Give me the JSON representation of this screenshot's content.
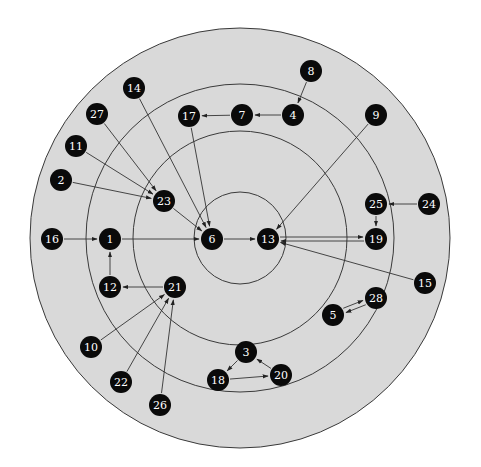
{
  "diagram": {
    "type": "concentric-directed-graph",
    "center": [
      240,
      238
    ],
    "colors": {
      "background": "#ffffff",
      "disk": "#d9d9d9",
      "ring_stroke": "#3a3a3a",
      "node": "#0a0a0a",
      "node_text": "#ffffff",
      "edge": "#333333"
    },
    "rings": [
      {
        "id": "outer",
        "r": 210,
        "fill": true
      },
      {
        "id": "ring3",
        "r": 154
      },
      {
        "id": "ring2",
        "r": 107
      },
      {
        "id": "ring1",
        "r": 46
      }
    ],
    "node_radius": 11,
    "nodes": [
      {
        "id": "1",
        "label": "1",
        "x": 110,
        "y": 239
      },
      {
        "id": "2",
        "label": "2",
        "x": 61,
        "y": 180
      },
      {
        "id": "3",
        "label": "3",
        "x": 246,
        "y": 352
      },
      {
        "id": "4",
        "label": "4",
        "x": 293,
        "y": 115
      },
      {
        "id": "5",
        "label": "5",
        "x": 333,
        "y": 315
      },
      {
        "id": "6",
        "label": "6",
        "x": 212,
        "y": 239
      },
      {
        "id": "7",
        "label": "7",
        "x": 242,
        "y": 115
      },
      {
        "id": "8",
        "label": "8",
        "x": 311,
        "y": 71
      },
      {
        "id": "9",
        "label": "9",
        "x": 376,
        "y": 115
      },
      {
        "id": "10",
        "label": "10",
        "x": 91,
        "y": 347
      },
      {
        "id": "11",
        "label": "11",
        "x": 76,
        "y": 146
      },
      {
        "id": "12",
        "label": "12",
        "x": 110,
        "y": 287
      },
      {
        "id": "13",
        "label": "13",
        "x": 268,
        "y": 239
      },
      {
        "id": "14",
        "label": "14",
        "x": 134,
        "y": 88
      },
      {
        "id": "15",
        "label": "15",
        "x": 425,
        "y": 283
      },
      {
        "id": "16",
        "label": "16",
        "x": 52,
        "y": 239
      },
      {
        "id": "17",
        "label": "17",
        "x": 189,
        "y": 116
      },
      {
        "id": "18",
        "label": "18",
        "x": 218,
        "y": 380
      },
      {
        "id": "19",
        "label": "19",
        "x": 376,
        "y": 239
      },
      {
        "id": "20",
        "label": "20",
        "x": 281,
        "y": 375
      },
      {
        "id": "21",
        "label": "21",
        "x": 175,
        "y": 287
      },
      {
        "id": "22",
        "label": "22",
        "x": 121,
        "y": 382
      },
      {
        "id": "23",
        "label": "23",
        "x": 164,
        "y": 201
      },
      {
        "id": "24",
        "label": "24",
        "x": 429,
        "y": 204
      },
      {
        "id": "25",
        "label": "25",
        "x": 376,
        "y": 204
      },
      {
        "id": "26",
        "label": "26",
        "x": 160,
        "y": 405
      },
      {
        "id": "27",
        "label": "27",
        "x": 97,
        "y": 114
      },
      {
        "id": "28",
        "label": "28",
        "x": 376,
        "y": 298
      }
    ],
    "edges": [
      {
        "from": "8",
        "to": "4"
      },
      {
        "from": "4",
        "to": "7"
      },
      {
        "from": "7",
        "to": "17"
      },
      {
        "from": "17",
        "to": "6"
      },
      {
        "from": "14",
        "to": "6"
      },
      {
        "from": "23",
        "to": "6"
      },
      {
        "from": "27",
        "to": "23"
      },
      {
        "from": "11",
        "to": "23"
      },
      {
        "from": "2",
        "to": "23"
      },
      {
        "from": "16",
        "to": "1"
      },
      {
        "from": "1",
        "to": "6"
      },
      {
        "from": "12",
        "to": "1"
      },
      {
        "from": "21",
        "to": "12"
      },
      {
        "from": "10",
        "to": "21"
      },
      {
        "from": "22",
        "to": "21"
      },
      {
        "from": "26",
        "to": "21"
      },
      {
        "from": "6",
        "to": "13"
      },
      {
        "from": "13",
        "to": "19",
        "offset": -2
      },
      {
        "from": "19",
        "to": "13",
        "offset": -2
      },
      {
        "from": "9",
        "to": "13"
      },
      {
        "from": "15",
        "to": "13"
      },
      {
        "from": "24",
        "to": "25"
      },
      {
        "from": "25",
        "to": "19"
      },
      {
        "from": "5",
        "to": "28",
        "offset": -2.5
      },
      {
        "from": "28",
        "to": "5",
        "offset": -2.5
      },
      {
        "from": "3",
        "to": "18"
      },
      {
        "from": "18",
        "to": "20"
      },
      {
        "from": "20",
        "to": "3"
      }
    ]
  }
}
